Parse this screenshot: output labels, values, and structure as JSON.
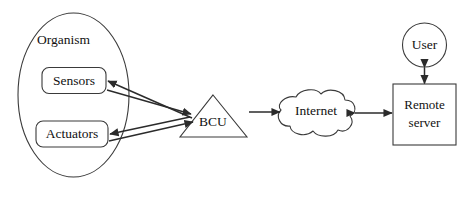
{
  "diagram": {
    "background_color": "#ffffff",
    "stroke_color": "#3a3a3a",
    "connector_color": "#2b2b2b",
    "text_color": "#111111",
    "nodes": {
      "organism": {
        "label": "Organism",
        "shape": "ellipse"
      },
      "sensors": {
        "label": "Sensors",
        "shape": "rounded-rectangle"
      },
      "actuators": {
        "label": "Actuators",
        "shape": "rounded-rectangle"
      },
      "bcu": {
        "label": "BCU",
        "shape": "triangle"
      },
      "internet": {
        "label": "Internet",
        "shape": "cloud"
      },
      "remote_server": {
        "label_line1": "Remote",
        "label_line2": "server",
        "shape": "rectangle"
      },
      "user": {
        "label": "User",
        "shape": "circle"
      }
    },
    "connectors": [
      {
        "name": "sensors-to-bcu",
        "from": "sensors",
        "to": "bcu",
        "arrows": "single"
      },
      {
        "name": "bcu-to-sensors",
        "from": "bcu",
        "to": "sensors",
        "arrows": "single"
      },
      {
        "name": "actuators-to-bcu",
        "from": "actuators",
        "to": "bcu",
        "arrows": "single"
      },
      {
        "name": "bcu-to-actuators",
        "from": "bcu",
        "to": "actuators",
        "arrows": "single"
      },
      {
        "name": "bcu-to-internet",
        "from": "bcu",
        "to": "internet",
        "arrows": "single"
      },
      {
        "name": "internet-to-remote-server",
        "from": "internet",
        "to": "remote_server",
        "arrows": "double"
      },
      {
        "name": "user-to-remote-server",
        "from": "user",
        "to": "remote_server",
        "arrows": "double"
      }
    ]
  }
}
